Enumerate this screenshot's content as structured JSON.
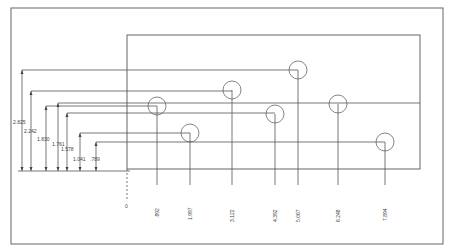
{
  "drawing": {
    "type": "ordinate-dimensioned hole pattern",
    "x_dimensions": [
      ".892",
      "1.997",
      "3.122",
      "4.392",
      "5.067",
      "6.248",
      "7.894"
    ],
    "y_dimensions": [
      "2.825",
      "2.242",
      "1.830",
      "1.761",
      "1.578",
      "1.041",
      ".789"
    ],
    "holes": [
      {
        "x_label": ".892",
        "y_label": "1.830",
        "cx": 157,
        "cy": 106
      },
      {
        "x_label": "1.997",
        "y_label": "1.041",
        "cx": 190,
        "cy": 133
      },
      {
        "x_label": "3.122",
        "y_label": "2.242",
        "cx": 232,
        "cy": 90
      },
      {
        "x_label": "4.392",
        "y_label": "1.578",
        "cx": 275,
        "cy": 114
      },
      {
        "x_label": "5.067",
        "y_label": "2.825",
        "cx": 298,
        "cy": 70
      },
      {
        "x_label": "6.248",
        "y_label": "1.761",
        "cx": 338,
        "cy": 104
      },
      {
        "x_label": "7.894",
        "y_label": ".789",
        "cx": 385,
        "cy": 142
      }
    ],
    "origin_marker": "0"
  },
  "colors": {
    "line": "#555555",
    "background": "#ffffff"
  }
}
